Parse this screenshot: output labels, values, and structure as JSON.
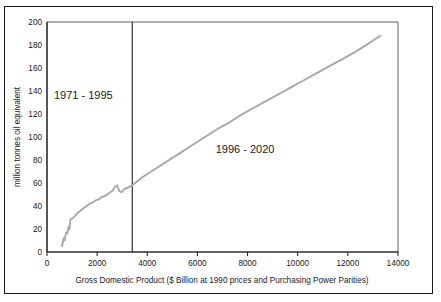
{
  "chart_data": {
    "type": "line",
    "title": "",
    "xlabel": "Gross Domestic Product ($ Billion at 1990 prices and Purchasing Power Parities)",
    "ylabel": "million tonnes oil equivalent",
    "xlim": [
      0,
      14000
    ],
    "ylim": [
      0,
      200
    ],
    "xticks": [
      "0",
      "2000",
      "4000",
      "6000",
      "8000",
      "10000",
      "12000",
      "14000"
    ],
    "yticks": [
      "0",
      "20",
      "40",
      "60",
      "80",
      "100",
      "120",
      "140",
      "160",
      "180",
      "200"
    ],
    "grid": false,
    "legend": "none",
    "line_color": "#a8a8a8",
    "divider_color": "#1a1a1a",
    "divider_x": 3400,
    "annotations": [
      {
        "label": "1971 - 1995",
        "x": 1450,
        "y": 133
      },
      {
        "label": "1996 - 2020",
        "x": 7900,
        "y": 86
      }
    ],
    "series": [
      {
        "name": "1971 - 1995 historical",
        "points": [
          [
            600,
            5
          ],
          [
            660,
            12
          ],
          [
            700,
            10
          ],
          [
            760,
            17
          ],
          [
            810,
            16
          ],
          [
            860,
            22
          ],
          [
            900,
            20
          ],
          [
            930,
            28
          ],
          [
            1000,
            29
          ],
          [
            1100,
            31
          ],
          [
            1220,
            34
          ],
          [
            1340,
            36
          ],
          [
            1460,
            38
          ],
          [
            1580,
            40
          ],
          [
            1700,
            42
          ],
          [
            1820,
            43
          ],
          [
            1950,
            45
          ],
          [
            2080,
            46
          ],
          [
            2200,
            48
          ],
          [
            2330,
            49
          ],
          [
            2460,
            51
          ],
          [
            2600,
            53
          ],
          [
            2720,
            57
          ],
          [
            2800,
            58
          ],
          [
            2880,
            53
          ],
          [
            2980,
            52
          ],
          [
            3100,
            55
          ],
          [
            3230,
            56
          ],
          [
            3400,
            58
          ]
        ]
      },
      {
        "name": "1996 - 2020 projected",
        "points": [
          [
            3400,
            58
          ],
          [
            3800,
            65
          ],
          [
            4300,
            72
          ],
          [
            4800,
            79
          ],
          [
            5300,
            86
          ],
          [
            5800,
            93
          ],
          [
            6300,
            100
          ],
          [
            6800,
            107
          ],
          [
            7300,
            113
          ],
          [
            7800,
            120
          ],
          [
            8300,
            126
          ],
          [
            8800,
            132
          ],
          [
            9300,
            138
          ],
          [
            9800,
            144
          ],
          [
            10300,
            150
          ],
          [
            10800,
            156
          ],
          [
            11300,
            162
          ],
          [
            11800,
            168
          ],
          [
            12300,
            174
          ],
          [
            12800,
            181
          ],
          [
            13300,
            188
          ]
        ]
      }
    ]
  }
}
